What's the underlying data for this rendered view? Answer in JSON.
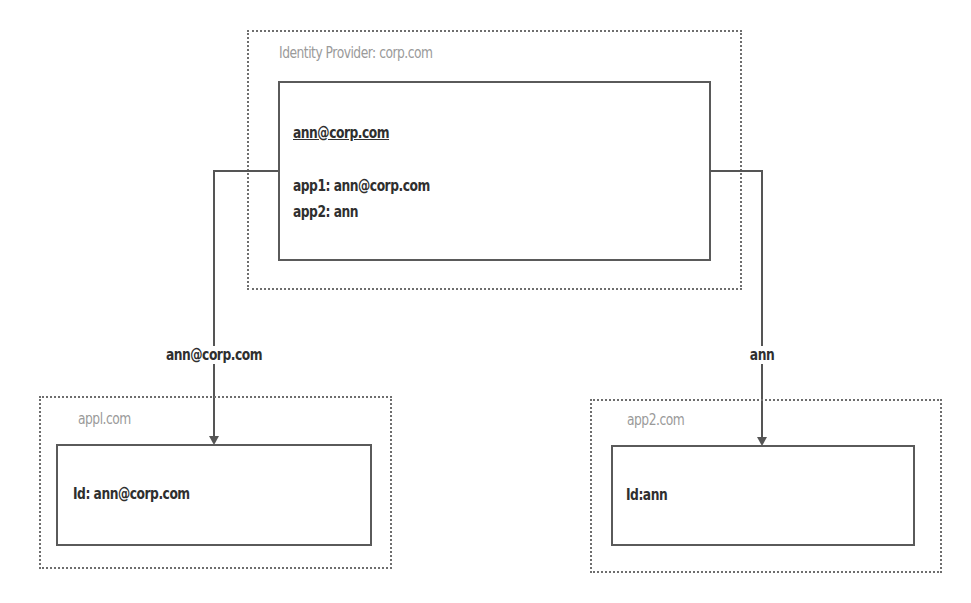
{
  "identity_provider": {
    "title": "Identity Provider: corp.com",
    "user": "ann@corp.com",
    "mappings": [
      "app1: ann@corp.com",
      "app2: ann"
    ]
  },
  "edges": [
    {
      "from": "identity_provider",
      "to": "app1",
      "label": "ann@corp.com"
    },
    {
      "from": "identity_provider",
      "to": "app2",
      "label": "ann"
    }
  ],
  "apps": [
    {
      "title": "appl.com",
      "id_text": "Id: ann@corp.com"
    },
    {
      "title": "app2.com",
      "id_text": "Id:ann"
    }
  ],
  "colors": {
    "outer_border": "#6e6e6e",
    "inner_border": "#5a5a5a",
    "title_text": "#9a9a9a",
    "body_text": "#2f2f2f",
    "connector": "#555555"
  }
}
